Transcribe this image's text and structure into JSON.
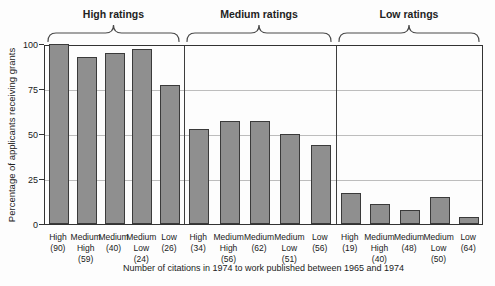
{
  "figure": {
    "y_axis_title": "Percentage of applicants receiving grants",
    "x_axis_caption": "Number of citations in 1974 to work published between 1965 and 1974"
  },
  "chart_data": {
    "type": "bar",
    "title": "",
    "ylabel": "Percentage of applicants receiving grants",
    "xlabel": "Number of citations in 1974 to work published between 1965 and 1974",
    "ylim": [
      0,
      100
    ],
    "yticks": [
      0,
      25,
      50,
      75,
      100
    ],
    "grid": true,
    "legend": "none",
    "bar_color": "#8f8f8f",
    "bar_border_color": "#3a3a3a",
    "groups": [
      {
        "label": "High ratings",
        "bars": [
          {
            "category": "High",
            "n": "(90)",
            "label_lines": [
              "High",
              "(90)"
            ],
            "value": 100
          },
          {
            "category": "Medium High",
            "n": "(59)",
            "label_lines": [
              "Medium",
              "High",
              "(59)"
            ],
            "value": 93
          },
          {
            "category": "Medium",
            "n": "(40)",
            "label_lines": [
              "Medium",
              "(40)"
            ],
            "value": 95
          },
          {
            "category": "Medium Low",
            "n": "(24)",
            "label_lines": [
              "Medium",
              "Low",
              "(24)"
            ],
            "value": 97
          },
          {
            "category": "Low",
            "n": "(26)",
            "label_lines": [
              "Low",
              "(26)"
            ],
            "value": 77
          }
        ]
      },
      {
        "label": "Medium ratings",
        "bars": [
          {
            "category": "High",
            "n": "(34)",
            "label_lines": [
              "High",
              "(34)"
            ],
            "value": 53
          },
          {
            "category": "Medium High",
            "n": "(56)",
            "label_lines": [
              "Medium",
              "High",
              "(56)"
            ],
            "value": 57
          },
          {
            "category": "Medium",
            "n": "(62)",
            "label_lines": [
              "Medium",
              "(62)"
            ],
            "value": 57
          },
          {
            "category": "Medium Low",
            "n": "(51)",
            "label_lines": [
              "Medium",
              "Low",
              "(51)"
            ],
            "value": 50
          },
          {
            "category": "Low",
            "n": "(56)",
            "label_lines": [
              "Low",
              "(56)"
            ],
            "value": 44
          }
        ]
      },
      {
        "label": "Low ratings",
        "bars": [
          {
            "category": "High",
            "n": "(19)",
            "label_lines": [
              "High",
              "(19)"
            ],
            "value": 17
          },
          {
            "category": "Medium High",
            "n": "(40)",
            "label_lines": [
              "Medium",
              "High",
              "(40)"
            ],
            "value": 11
          },
          {
            "category": "Medium",
            "n": "(48)",
            "label_lines": [
              "Medium",
              "(48)"
            ],
            "value": 8
          },
          {
            "category": "Medium Low",
            "n": "(50)",
            "label_lines": [
              "Medium",
              "Low",
              "(50)"
            ],
            "value": 15
          },
          {
            "category": "Low",
            "n": "(64)",
            "label_lines": [
              "Low",
              "(64)"
            ],
            "value": 4
          }
        ]
      }
    ]
  }
}
